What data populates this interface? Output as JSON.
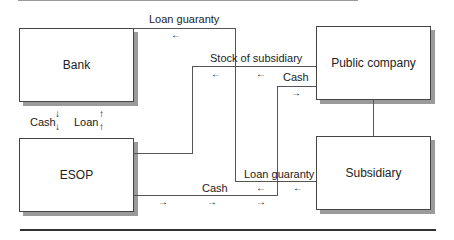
{
  "entities": {
    "bank": "Bank",
    "esop": "ESOP",
    "public_company": "Public company",
    "subsidiary": "Subsidiary"
  },
  "flows": {
    "loan_guaranty_top": "Loan guaranty",
    "stock_of_subsidiary": "Stock of subsidiary",
    "cash_public": "Cash",
    "cash_bank": "Cash",
    "loan_bank": "Loan",
    "loan_guaranty_bottom": "Loan guaranty",
    "cash_esop": "Cash"
  },
  "arrows": {
    "left": "←",
    "right": "→",
    "down": "↓",
    "up": "↑"
  }
}
